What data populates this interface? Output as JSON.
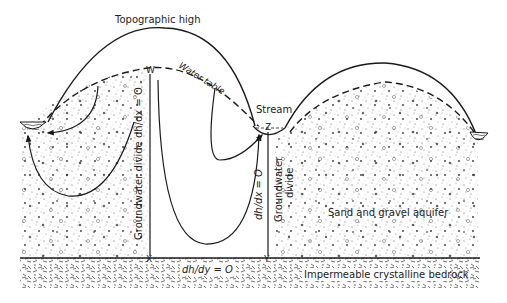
{
  "diagram": {
    "type": "hydrogeologic-cross-section",
    "labels": {
      "topographic_high": "Topographic high",
      "water_table": "Water table",
      "stream": "Stream",
      "point_w": "W",
      "point_x": "X",
      "point_y": "Y",
      "point_z": "Z",
      "left_divide": "Groundwater divide dh/dx = O",
      "right_divide_eq": "dh/dx = O",
      "right_divide_text": "Groundwater",
      "right_divide_text2": "divide",
      "bottom_boundary": "dh/dy = O",
      "aquifer": "Sand and gravel aquifer",
      "bedrock": "Impermeable crystalline bedrock"
    },
    "colors": {
      "ink": "#1a1a1a",
      "background": "#ffffff",
      "stipple": "#444444"
    }
  }
}
